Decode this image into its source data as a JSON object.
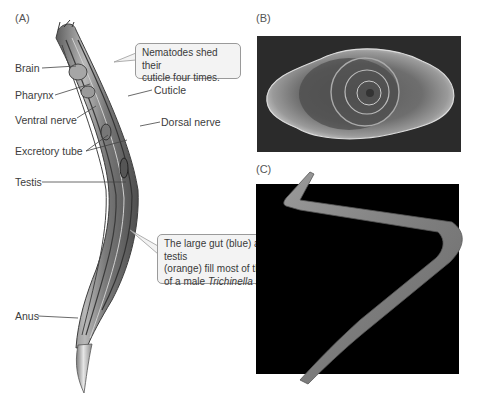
{
  "panels": {
    "a": {
      "label": "(A)"
    },
    "b": {
      "label": "(B)"
    },
    "c": {
      "label": "(C)"
    }
  },
  "labels": {
    "brain": "Brain",
    "pharynx": "Pharynx",
    "ventral_nerve": "Ventral nerve",
    "excretory_tube": "Excretory tube",
    "testis": "Testis",
    "anus": "Anus",
    "cuticle": "Cuticle",
    "dorsal_nerve": "Dorsal nerve"
  },
  "callouts": {
    "cuticle_shed": {
      "line1": "Nematodes shed their",
      "line2": "cuticle four times."
    },
    "gut_testis": {
      "line1": "The large gut (blue) and testis",
      "line2": "(orange) fill most of the body",
      "line3_prefix": "of a male ",
      "line3_species": "Trichinella spiralis",
      "line3_suffix": "."
    }
  },
  "colors": {
    "background": "#ffffff",
    "callout_fill": "#f3f3f3",
    "callout_border": "#9a9a9a",
    "photo_b_bg": "#2a2a2a",
    "photo_c_bg": "#000000",
    "worm_body": "#8a8a8a"
  }
}
